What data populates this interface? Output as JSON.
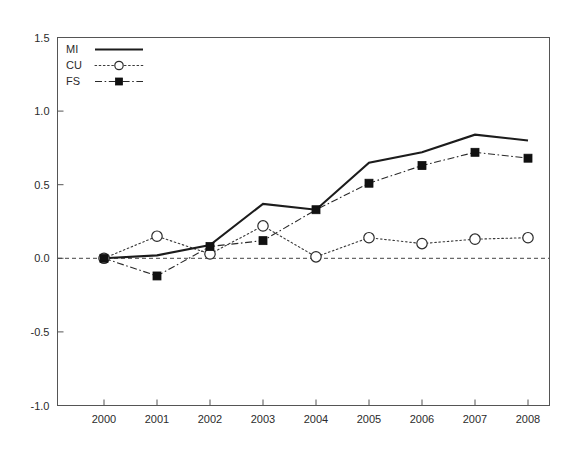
{
  "chart_data": {
    "type": "line",
    "title": "",
    "subtitle": "",
    "xlabel": "",
    "ylabel": "",
    "categories": [
      "2000",
      "2001",
      "2002",
      "2003",
      "2004",
      "2005",
      "2006",
      "2007",
      "2008"
    ],
    "x": [
      2000,
      2001,
      2002,
      2003,
      2004,
      2005,
      2006,
      2007,
      2008
    ],
    "xlim": [
      1999.6,
      2008.6
    ],
    "ylim": [
      -1.0,
      1.5
    ],
    "yticks": [
      "1.5",
      "1.0",
      "0.5",
      "0.0",
      "-0.5",
      "-1.0"
    ],
    "ytick_values": [
      1.5,
      1.0,
      0.5,
      0.0,
      -0.5,
      -1.0
    ],
    "xticks": [
      "2000",
      "2001",
      "2002",
      "2003",
      "2004",
      "2005",
      "2006",
      "2007",
      "2008"
    ],
    "grid": false,
    "zero_reference_line": 0.0,
    "legend_position": "top-left",
    "series": [
      {
        "name": "MI",
        "style": "solid",
        "marker": "none",
        "color": "#1c1c1c",
        "values": [
          0.0,
          0.02,
          0.09,
          0.37,
          0.33,
          0.65,
          0.72,
          0.84,
          0.8
        ]
      },
      {
        "name": "CU",
        "style": "dotted",
        "marker": "open-circle",
        "color": "#2b2b2b",
        "values": [
          0.0,
          0.15,
          0.03,
          0.22,
          0.01,
          0.14,
          0.1,
          0.13,
          0.14
        ]
      },
      {
        "name": "FS",
        "style": "dash-dot",
        "marker": "filled-square",
        "color": "#111111",
        "values": [
          0.0,
          -0.12,
          0.08,
          0.12,
          0.33,
          0.51,
          0.63,
          0.72,
          0.68
        ]
      }
    ]
  },
  "legend": {
    "entries": [
      {
        "label": "MI"
      },
      {
        "label": "CU"
      },
      {
        "label": "FS"
      }
    ]
  },
  "axes": {
    "y_labels": [
      "1.5",
      "1.0",
      "0.5",
      "0.0",
      "-0.5",
      "-1.0"
    ],
    "x_labels": [
      "2000",
      "2001",
      "2002",
      "2003",
      "2004",
      "2005",
      "2006",
      "2007",
      "2008"
    ]
  }
}
